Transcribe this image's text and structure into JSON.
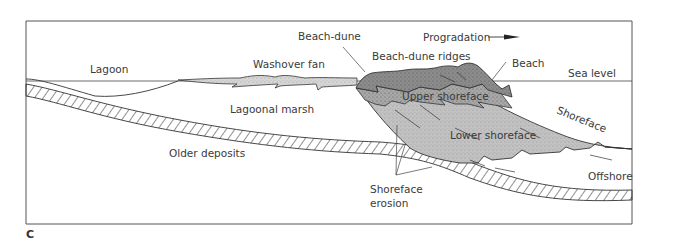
{
  "figure": {
    "panel_letter": "C",
    "labels": {
      "lagoon": "Lagoon",
      "washover_fan": "Washover fan",
      "beach_dune": "Beach-dune",
      "progradation": "Progradation",
      "beach_dune_ridges": "Beach-dune ridges",
      "beach": "Beach",
      "sea_level": "Sea level",
      "lagoonal_marsh": "Lagoonal marsh",
      "upper_shoreface": "Upper shoreface",
      "shoreface": "Shoreface",
      "lower_shoreface": "Lower shoreface",
      "older_deposits": "Older deposits",
      "offshore": "Offshore",
      "shoreface_erosion_line1": "Shoreface",
      "shoreface_erosion_line2": "erosion"
    },
    "arrow": {
      "direction": "right",
      "meaning": "Progradation"
    },
    "colors": {
      "frame": "#555555",
      "dune_fill": "#8a8a8a",
      "upper_shoreface_fill": "#a9a9a9",
      "lower_shoreface_fill": "#bdbdbd",
      "washover_fill": "#d4d4d4",
      "line": "#3a3a3a"
    }
  }
}
